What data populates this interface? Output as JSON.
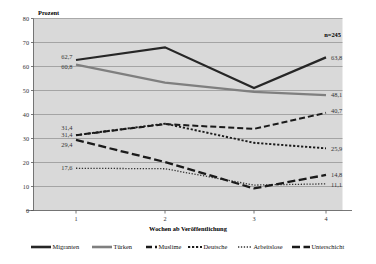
{
  "chart_data": {
    "type": "line",
    "title": "",
    "xlabel": "Wochen ab Veröffentlichung",
    "ylabel": "Prozent",
    "categories": [
      "1",
      "2",
      "3",
      "4"
    ],
    "x_ticks": [
      "1",
      "2",
      "3",
      "4"
    ],
    "y_ticks": [
      "0",
      "10",
      "20",
      "30",
      "40",
      "50",
      "60",
      "70",
      "80"
    ],
    "ylim": [
      0,
      80
    ],
    "grid": true,
    "legend_position": "bottom",
    "annotation": "n=245",
    "series": [
      {
        "name": "Migranten",
        "values": [
          62.7,
          68.0,
          51.0,
          63.8
        ],
        "color": "#262626",
        "style": "solid",
        "width": 2.2,
        "start_label": "62,7",
        "end_label": "63,8"
      },
      {
        "name": "Türken",
        "values": [
          60.8,
          53.3,
          49.4,
          48.1
        ],
        "color": "#7f7f7f",
        "style": "solid",
        "width": 2.2,
        "start_label": "60,8",
        "end_label": "48,1"
      },
      {
        "name": "Muslime",
        "values": [
          31.4,
          36.0,
          34.0,
          40.7
        ],
        "color": "#1a1a1a",
        "style": "dashed",
        "width": 2.0,
        "start_label": "31,4",
        "end_label": "40,7"
      },
      {
        "name": "Deutsche",
        "values": [
          31.4,
          36.2,
          28.2,
          25.9
        ],
        "color": "#1a1a1a",
        "style": "dotted-coarse",
        "width": 1.9,
        "start_label": "31,4",
        "end_label": "25,9"
      },
      {
        "name": "Arbeitslose",
        "values": [
          17.6,
          17.4,
          10.6,
          11.1
        ],
        "color": "#333333",
        "style": "dotted-fine",
        "width": 1.3,
        "start_label": "17,6",
        "end_label": "11,1"
      },
      {
        "name": "Unterschicht",
        "values": [
          29.4,
          20.2,
          9.2,
          14.8
        ],
        "color": "#1a1a1a",
        "style": "dashed-long",
        "width": 2.3,
        "start_label": "29,4",
        "end_label": "14,8"
      }
    ]
  },
  "labels": {
    "y_axis_caption": "Prozent",
    "x_axis_caption": "Wochen ab Veröffentlichung",
    "sample_size": "n=245"
  },
  "left_labels": [
    {
      "text": "62,7",
      "value": 62.7
    },
    {
      "text": "60,8",
      "value": 60.8
    },
    {
      "text": "31,4",
      "value": 31.4
    },
    {
      "text": "31,4",
      "value": 31.4
    },
    {
      "text": "29,4",
      "value": 29.4
    },
    {
      "text": "17,6",
      "value": 17.6
    }
  ],
  "right_labels": [
    {
      "text": "63,8",
      "value": 63.8
    },
    {
      "text": "48,1",
      "value": 48.1
    },
    {
      "text": "40,7",
      "value": 40.7
    },
    {
      "text": "25,9",
      "value": 25.9
    },
    {
      "text": "14,8",
      "value": 14.8
    },
    {
      "text": "11,1",
      "value": 11.1
    }
  ],
  "legend": {
    "items": [
      {
        "label": "Migranten",
        "color": "#262626",
        "style": "solid"
      },
      {
        "label": "Türken",
        "color": "#7f7f7f",
        "style": "solid"
      },
      {
        "label": "Muslime",
        "color": "#1a1a1a",
        "style": "dashed"
      },
      {
        "label": "Deutsche",
        "color": "#1a1a1a",
        "style": "dotted-coarse"
      },
      {
        "label": "Arbeitslose",
        "color": "#333333",
        "style": "dotted-fine"
      },
      {
        "label": "Unterschicht",
        "color": "#1a1a1a",
        "style": "dashed-long"
      }
    ]
  },
  "colors": {
    "plot_background": "#d9d9d9",
    "page_background": "#ffffff",
    "gridline": "#8c8c8c",
    "axis": "#555555"
  }
}
